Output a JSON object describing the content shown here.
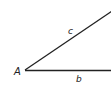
{
  "diagram": {
    "type": "triangle-fragment",
    "vertices": [
      {
        "label": "A",
        "x": 25,
        "y": 70
      }
    ],
    "sides": [
      {
        "label": "c",
        "from": [
          25,
          70
        ],
        "to": [
          111,
          12
        ]
      },
      {
        "label": "b",
        "from": [
          25,
          70
        ],
        "to": [
          111,
          70
        ]
      }
    ],
    "labels": {
      "vertex_a": "A",
      "side_c": "c",
      "side_b": "b"
    },
    "colors": {
      "line": "#222222",
      "background": "#ffffff"
    }
  }
}
